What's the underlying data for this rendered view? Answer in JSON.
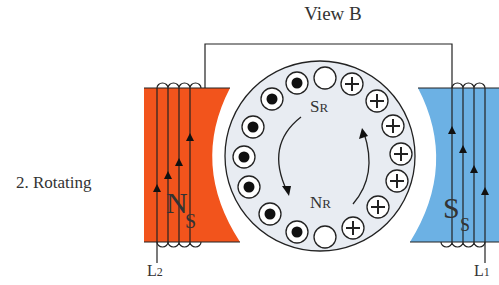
{
  "title": "View B",
  "side_label": "2. Rotating",
  "colors": {
    "north_pole": "#f2541c",
    "south_pole": "#6cb1e4",
    "rotor_fill": "#e8ecf2",
    "line": "#222222",
    "text": "#333333"
  },
  "stator": {
    "left_pole": {
      "main": "N",
      "sub": "S",
      "label": "Ns"
    },
    "right_pole": {
      "main": "S",
      "sub": "S",
      "label": "Ss"
    }
  },
  "rotor": {
    "top_label": {
      "main": "S",
      "sub": "R"
    },
    "bottom_label": {
      "main": "N",
      "sub": "R"
    },
    "conductors_left": "dot",
    "conductors_right": "plus",
    "conductors_neutral": "empty"
  },
  "leads": {
    "left": {
      "main": "L",
      "sub": "2"
    },
    "right": {
      "main": "L",
      "sub": "1"
    }
  }
}
